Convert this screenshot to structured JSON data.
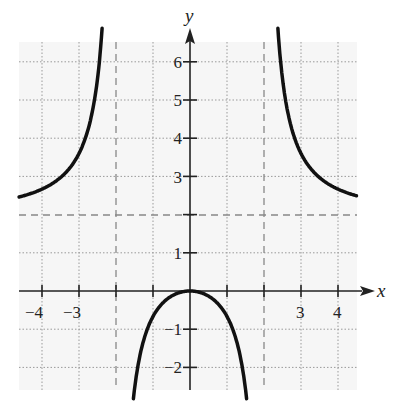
{
  "chart_data": {
    "type": "line",
    "title": "",
    "xlabel": "x",
    "ylabel": "y",
    "xlim": [
      -4.65,
      4.5
    ],
    "ylim": [
      -2.6,
      6.6
    ],
    "grid": true,
    "function_description": "y = 2x^2/(x^2-4)",
    "x_tick_labels": [
      "-4",
      "-3",
      "3",
      "4"
    ],
    "y_tick_labels": [
      "-2",
      "-1",
      "1",
      "3",
      "4",
      "5",
      "6"
    ],
    "asymptotes": {
      "vertical": [
        -2,
        2
      ],
      "horizontal": [
        2
      ]
    },
    "series": [
      {
        "name": "left branch",
        "x": [
          -4.65,
          -4,
          -3.5,
          -3,
          -2.75,
          -2.5,
          -2.4,
          -2.3
        ],
        "y": [
          2.45,
          2.67,
          2.97,
          3.6,
          4.24,
          5.56,
          6.55,
          7.0
        ]
      },
      {
        "name": "middle branch",
        "x": [
          -1.55,
          -1.25,
          -1,
          -0.5,
          0,
          0.5,
          1,
          1.25,
          1.55
        ],
        "y": [
          -2.45,
          -1.28,
          -0.67,
          -0.13,
          0,
          -0.13,
          -0.67,
          -1.28,
          -2.45
        ]
      },
      {
        "name": "right branch",
        "x": [
          2.3,
          2.4,
          2.5,
          2.75,
          3,
          3.5,
          4,
          4.5
        ],
        "y": [
          7.0,
          6.55,
          5.56,
          4.24,
          3.6,
          2.97,
          2.67,
          2.48
        ]
      }
    ]
  },
  "labels": {
    "x_axis": "x",
    "y_axis": "y",
    "xticks": {
      "m4": "−4",
      "m3": "−3",
      "p3": "3",
      "p4": "4"
    },
    "yticks": {
      "m2": "−2",
      "m1": "−1",
      "p1": "1",
      "p3": "3",
      "p4": "4",
      "p5": "5",
      "p6": "6"
    }
  }
}
